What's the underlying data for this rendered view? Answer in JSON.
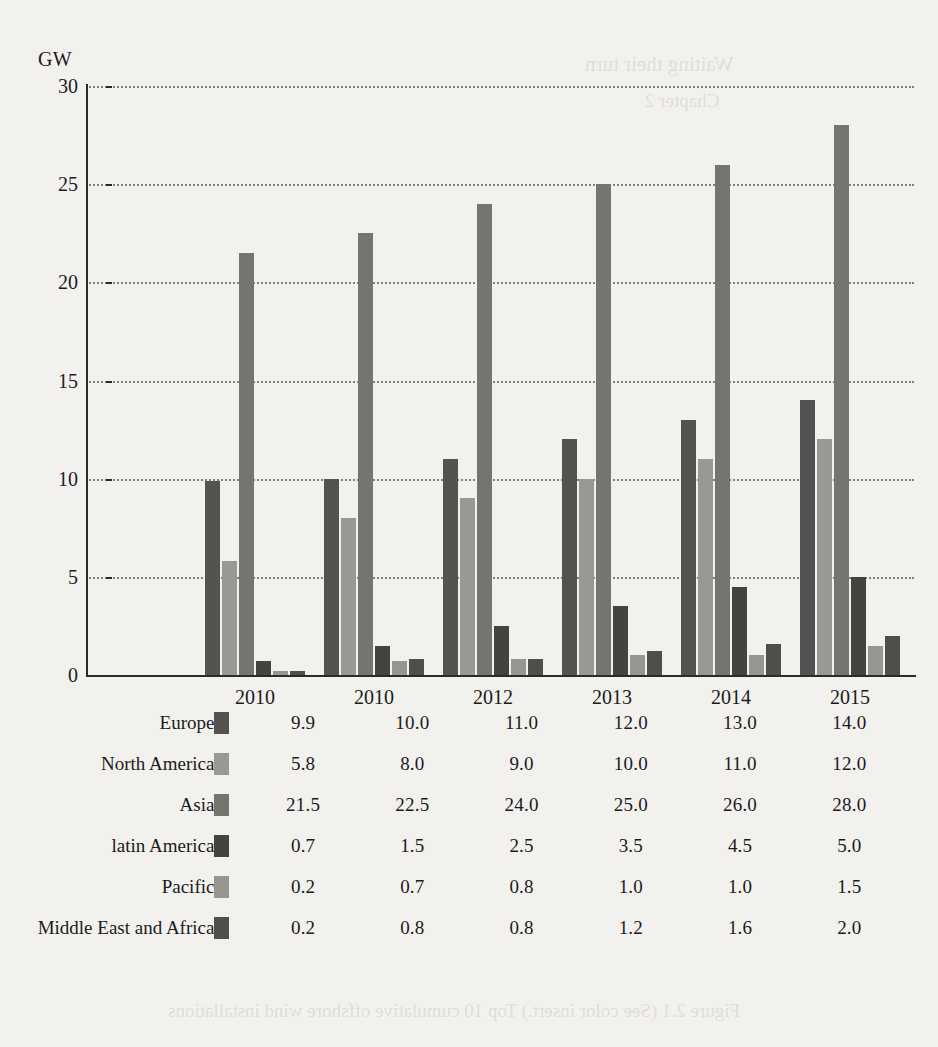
{
  "axis": {
    "y_unit_label": "GW",
    "y_ticks": [
      "30",
      "25",
      "20",
      "15",
      "10",
      "5",
      "0"
    ],
    "x_labels": [
      "2010",
      "2010",
      "2012",
      "2013",
      "2014",
      "2015"
    ]
  },
  "series_colors": {
    "europe": "#555352",
    "north_america": "#9a9894",
    "asia": "#76746f",
    "latin_america": "#45433f",
    "pacific": "#97958f",
    "middle_east_africa": "#504e4a"
  },
  "table": {
    "rows": [
      {
        "label": "Europe",
        "swatch": "#555352",
        "values": [
          "9.9",
          "10.0",
          "11.0",
          "12.0",
          "13.0",
          "14.0"
        ]
      },
      {
        "label": "North America",
        "swatch": "#9a9894",
        "values": [
          "5.8",
          "8.0",
          "9.0",
          "10.0",
          "11.0",
          "12.0"
        ]
      },
      {
        "label": "Asia",
        "swatch": "#76746f",
        "values": [
          "21.5",
          "22.5",
          "24.0",
          "25.0",
          "26.0",
          "28.0"
        ]
      },
      {
        "label": "latin America",
        "swatch": "#45433f",
        "values": [
          "0.7",
          "1.5",
          "2.5",
          "3.5",
          "4.5",
          "5.0"
        ]
      },
      {
        "label": "Pacific",
        "swatch": "#97958f",
        "values": [
          "0.2",
          "0.7",
          "0.8",
          "1.0",
          "1.0",
          "1.5"
        ]
      },
      {
        "label": "Middle East and Africa",
        "swatch": "#504e4a",
        "values": [
          "0.2",
          "0.8",
          "0.8",
          "1.2",
          "1.6",
          "2.0"
        ]
      }
    ]
  },
  "showthrough": {
    "a": "Waiting their turn",
    "b": "Chapter 2",
    "c": "Figure 2.1 (See color insert.) Top 10 cumulative offshore wind installations"
  },
  "chart_data": {
    "type": "bar",
    "title": "",
    "xlabel": "",
    "ylabel": "GW",
    "ylim": [
      0,
      30
    ],
    "yticks": [
      0,
      5,
      10,
      15,
      20,
      25,
      30
    ],
    "grid": true,
    "legend": "table-below",
    "categories": [
      "2010",
      "2010",
      "2012",
      "2013",
      "2014",
      "2015"
    ],
    "series": [
      {
        "name": "Europe",
        "color": "#555352",
        "values": [
          9.9,
          10.0,
          11.0,
          12.0,
          13.0,
          14.0
        ]
      },
      {
        "name": "North America",
        "color": "#9a9894",
        "values": [
          5.8,
          8.0,
          9.0,
          10.0,
          11.0,
          12.0
        ]
      },
      {
        "name": "Asia",
        "color": "#76746f",
        "values": [
          21.5,
          22.5,
          24.0,
          25.0,
          26.0,
          28.0
        ]
      },
      {
        "name": "latin America",
        "color": "#45433f",
        "values": [
          0.7,
          1.5,
          2.5,
          3.5,
          4.5,
          5.0
        ]
      },
      {
        "name": "Pacific",
        "color": "#97958f",
        "values": [
          0.2,
          0.7,
          0.8,
          1.0,
          1.0,
          1.5
        ]
      },
      {
        "name": "Middle East and Africa",
        "color": "#504e4a",
        "values": [
          0.2,
          0.8,
          0.8,
          1.2,
          1.6,
          2.0
        ]
      }
    ]
  }
}
